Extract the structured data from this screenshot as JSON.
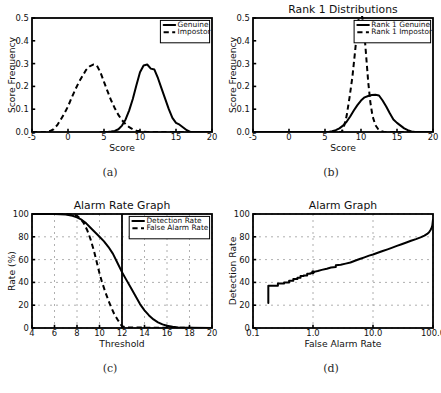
{
  "figure": {
    "background": "#ffffff",
    "line_color": "#000000",
    "grid_color": "#9a9a9a",
    "panel_captions": [
      "(a)",
      "(b)",
      "(c)",
      "(d)"
    ]
  },
  "chart_data": [
    {
      "panel": "(a)",
      "type": "line",
      "title": "",
      "xlabel": "Score",
      "ylabel": "Score Frequency",
      "xlim": [
        -5,
        20
      ],
      "ylim": [
        0,
        0.5
      ],
      "xticks": [
        -5,
        0,
        5,
        10,
        15,
        20
      ],
      "yticks": [
        0.0,
        0.1,
        0.2,
        0.3,
        0.4,
        0.5
      ],
      "xticklabels": [
        "-5",
        "0",
        "5",
        "10",
        "15",
        "20"
      ],
      "yticklabels": [
        "0.0",
        "0.1",
        "0.2",
        "0.3",
        "0.4",
        "0.5"
      ],
      "grid": false,
      "legend_position": "upper right",
      "series": [
        {
          "name": "Genuine",
          "style": "solid",
          "x": [
            4.5,
            5.5,
            6.0,
            6.5,
            7.0,
            7.5,
            8.0,
            8.5,
            9.0,
            9.5,
            10.0,
            10.5,
            11.0,
            11.5,
            12.0,
            12.5,
            13.0,
            13.5,
            14.0,
            14.5,
            15.0,
            15.5,
            16.0,
            16.5,
            17.0,
            17.5,
            20.0
          ],
          "y": [
            0.0,
            0.0,
            0.002,
            0.005,
            0.012,
            0.028,
            0.055,
            0.095,
            0.145,
            0.205,
            0.262,
            0.292,
            0.296,
            0.278,
            0.274,
            0.236,
            0.19,
            0.145,
            0.1,
            0.062,
            0.04,
            0.032,
            0.02,
            0.008,
            0.0,
            0.0,
            0.0
          ]
        },
        {
          "name": "Impostor",
          "style": "dashed",
          "x": [
            -5.0,
            -3.0,
            -2.5,
            -2.0,
            -1.5,
            -1.0,
            -0.5,
            0.0,
            0.5,
            1.0,
            1.5,
            2.0,
            2.5,
            3.0,
            3.5,
            4.0,
            4.5,
            5.0,
            5.5,
            6.0,
            6.5,
            7.0,
            7.5,
            8.0,
            8.5,
            9.0,
            9.5,
            10.0,
            10.5,
            11.0,
            20.0
          ],
          "y": [
            0.0,
            0.0,
            0.004,
            0.012,
            0.03,
            0.055,
            0.082,
            0.112,
            0.15,
            0.185,
            0.218,
            0.245,
            0.272,
            0.288,
            0.296,
            0.292,
            0.262,
            0.22,
            0.178,
            0.138,
            0.104,
            0.075,
            0.052,
            0.034,
            0.021,
            0.012,
            0.006,
            0.003,
            0.001,
            0.0,
            0.0
          ]
        }
      ]
    },
    {
      "panel": "(b)",
      "type": "line",
      "title": "Rank 1 Distributions",
      "xlabel": "Score",
      "ylabel": "Score Frequency",
      "xlim": [
        -5,
        20
      ],
      "ylim": [
        0,
        0.5
      ],
      "xticks": [
        -5,
        0,
        5,
        10,
        15,
        20
      ],
      "yticks": [
        0.0,
        0.1,
        0.2,
        0.3,
        0.4,
        0.5
      ],
      "xticklabels": [
        "-5",
        "0",
        "5",
        "10",
        "15",
        "20"
      ],
      "yticklabels": [
        "0.0",
        "0.1",
        "0.2",
        "0.3",
        "0.4",
        "0.5"
      ],
      "grid": false,
      "legend_position": "upper right",
      "series": [
        {
          "name": "Rank 1 Genuine",
          "style": "solid",
          "x": [
            -5.0,
            5.5,
            6.0,
            6.5,
            7.0,
            7.5,
            8.0,
            8.5,
            9.0,
            9.5,
            10.0,
            10.5,
            11.0,
            11.5,
            12.0,
            12.5,
            13.0,
            13.5,
            14.0,
            14.5,
            15.0,
            15.5,
            16.0,
            16.5,
            17.0,
            17.5,
            20.0
          ],
          "y": [
            0.0,
            0.0,
            0.003,
            0.008,
            0.016,
            0.028,
            0.045,
            0.068,
            0.094,
            0.118,
            0.138,
            0.152,
            0.158,
            0.162,
            0.163,
            0.16,
            0.138,
            0.112,
            0.082,
            0.055,
            0.04,
            0.028,
            0.016,
            0.008,
            0.002,
            0.0,
            0.0
          ]
        },
        {
          "name": "Rank 1 Impostor",
          "style": "dashed",
          "x": [
            -5.0,
            7.3,
            7.6,
            8.0,
            8.4,
            8.8,
            9.2,
            9.5,
            9.8,
            10.0,
            10.2,
            10.5,
            10.8,
            11.0,
            11.3,
            11.6,
            12.0,
            12.4,
            12.8,
            13.2,
            20.0
          ],
          "y": [
            0.0,
            0.0,
            0.02,
            0.07,
            0.15,
            0.24,
            0.36,
            0.46,
            0.52,
            0.53,
            0.5,
            0.42,
            0.3,
            0.22,
            0.13,
            0.07,
            0.03,
            0.012,
            0.004,
            0.0,
            0.0
          ]
        }
      ]
    },
    {
      "panel": "(c)",
      "type": "line",
      "title": "Alarm Rate Graph",
      "xlabel": "Threshold",
      "ylabel": "Rate (%)",
      "xlim": [
        4,
        20
      ],
      "ylim": [
        0,
        100
      ],
      "xticks": [
        4,
        6,
        8,
        10,
        12,
        14,
        16,
        18,
        20
      ],
      "yticks": [
        0,
        20,
        40,
        60,
        80,
        100
      ],
      "xticklabels": [
        "4",
        "6",
        "8",
        "10",
        "12",
        "14",
        "16",
        "18",
        "20"
      ],
      "yticklabels": [
        "0",
        "20",
        "40",
        "60",
        "80",
        "100"
      ],
      "grid": true,
      "legend_position": "upper right",
      "threshold_marker": 12,
      "series": [
        {
          "name": "Detection Rate",
          "style": "solid",
          "x": [
            4.0,
            6.0,
            7.0,
            7.6,
            8.0,
            8.4,
            8.8,
            9.2,
            9.6,
            10.0,
            10.4,
            10.8,
            11.2,
            11.6,
            12.0,
            12.4,
            12.8,
            13.2,
            13.6,
            14.0,
            14.4,
            14.8,
            15.2,
            15.6,
            16.0,
            16.5,
            17.0,
            18.0,
            20.0
          ],
          "y": [
            100,
            100,
            99.5,
            98.5,
            97,
            95,
            92,
            88,
            84,
            80,
            76,
            71,
            65,
            57,
            49,
            42,
            35,
            28,
            21,
            15.5,
            11,
            7.5,
            5,
            3.2,
            2,
            1.1,
            0.5,
            0.2,
            0.0
          ]
        },
        {
          "name": "False Alarm Rate",
          "style": "dashed",
          "x": [
            4.0,
            7.0,
            7.6,
            8.0,
            8.3,
            8.6,
            8.9,
            9.2,
            9.5,
            9.8,
            10.0,
            10.2,
            10.5,
            10.8,
            11.0,
            11.3,
            11.6,
            11.9,
            12.0,
            12.4,
            20.0
          ],
          "y": [
            100,
            100,
            99.5,
            98.5,
            96,
            92,
            86,
            78,
            68,
            56,
            48,
            41,
            32,
            24,
            19,
            12.5,
            7.5,
            3.0,
            1.5,
            0.4,
            0.0
          ]
        }
      ]
    },
    {
      "panel": "(d)",
      "type": "line",
      "title": "Alarm Graph",
      "xlabel": "False Alarm Rate",
      "ylabel": "Detection Rate",
      "xscale": "log",
      "xlim": [
        0.1,
        100.0
      ],
      "ylim": [
        0,
        100
      ],
      "xticks": [
        0.1,
        1.0,
        10.0,
        100.0
      ],
      "yticks": [
        0,
        20,
        40,
        60,
        80,
        100
      ],
      "xticklabels": [
        "0.1",
        "1.0",
        "10.0",
        "100.0"
      ],
      "yticklabels": [
        "0",
        "20",
        "40",
        "60",
        "80",
        "100"
      ],
      "grid": true,
      "legend_position": "none",
      "marker_point": [
        1.0,
        49
      ],
      "series": [
        {
          "name": "ROC",
          "style": "solid",
          "x": [
            0.18,
            0.18,
            0.2,
            0.26,
            0.26,
            0.33,
            0.33,
            0.4,
            0.4,
            0.47,
            0.47,
            0.55,
            0.55,
            0.62,
            0.62,
            0.7,
            0.7,
            0.8,
            0.8,
            0.9,
            0.9,
            1.0,
            1.0,
            1.2,
            1.4,
            1.7,
            2.0,
            2.4,
            2.4,
            2.9,
            3.5,
            4.2,
            5.0,
            6.0,
            7.2,
            8.6,
            10.0,
            12.0,
            14.5,
            17.5,
            21.0,
            25.0,
            30.0,
            36.0,
            43.0,
            52.0,
            62.0,
            72.0,
            80.0,
            86.0,
            91.0,
            95.0,
            97.5,
            99.0,
            100.0
          ],
          "y": [
            22,
            37,
            37,
            37,
            39,
            39,
            40,
            40,
            41.5,
            41.5,
            43,
            43,
            44,
            44,
            45.5,
            45.5,
            46,
            46,
            47.5,
            47.5,
            48,
            48,
            49,
            50,
            51,
            52,
            53,
            53.5,
            55,
            55.5,
            56.5,
            57.5,
            59,
            60.5,
            62,
            63.5,
            64.5,
            66,
            67.5,
            69,
            70.5,
            72,
            73.5,
            75,
            76.5,
            78,
            79.5,
            81,
            82.5,
            84,
            86,
            88,
            90,
            93,
            95
          ]
        }
      ]
    }
  ]
}
